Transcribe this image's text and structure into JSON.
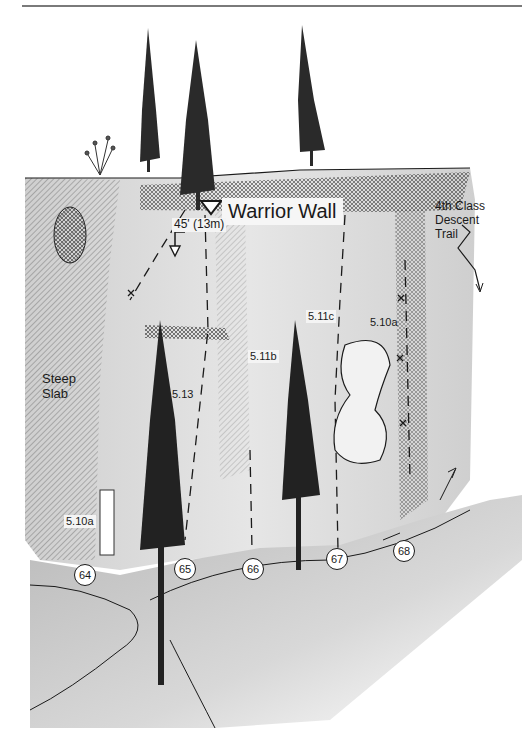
{
  "topo": {
    "title": "Warrior Wall",
    "height_note": "45' (13m)",
    "descent_label_lines": [
      "4th Class",
      "Descent",
      "Trail"
    ],
    "area_label_lines": [
      "Steep",
      "Slab"
    ],
    "grades": {
      "route_64": "5.10a",
      "route_65": "5.13",
      "route_66": "5.11b",
      "route_67": "5.11c",
      "route_68": "5.10a"
    },
    "route_numbers": [
      "64",
      "65",
      "66",
      "67",
      "68"
    ],
    "colors": {
      "ink": "#1a1a1a",
      "rock_light": "#d9d9d9",
      "rock_mid": "#b5b5b5",
      "ground": "#c8c8c8",
      "paper": "#ffffff"
    }
  }
}
